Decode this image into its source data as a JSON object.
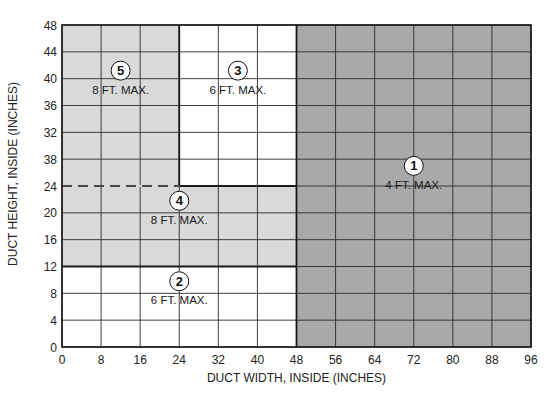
{
  "chart_data": {
    "type": "heatmap",
    "title": "",
    "xlabel": "DUCT WIDTH, INSIDE (INCHES)",
    "ylabel": "DUCT HEIGHT, INSIDE (INCHES)",
    "xlim": [
      0,
      96
    ],
    "ylim": [
      0,
      48
    ],
    "grid": true,
    "x_ticks": [
      0,
      8,
      16,
      24,
      32,
      40,
      48,
      56,
      64,
      72,
      80,
      88,
      96
    ],
    "x_tick_labels": [
      "0",
      "8",
      "16",
      "24",
      "32",
      "40",
      "48",
      "56",
      "64",
      "72",
      "80",
      "88",
      "96"
    ],
    "y_ticks": [
      0,
      4,
      8,
      12,
      16,
      20,
      24,
      28,
      32,
      36,
      40,
      44,
      48
    ],
    "y_tick_labels": [
      "0",
      "4",
      "8",
      "12",
      "16",
      "20",
      "24",
      "38",
      "32",
      "36",
      "40",
      "44",
      "48"
    ],
    "regions": [
      {
        "id": "1",
        "label": "4 FT. MAX.",
        "x": [
          48,
          96
        ],
        "y": [
          0,
          48
        ],
        "fill": "#a9a9a9",
        "label_at": [
          72,
          27
        ]
      },
      {
        "id": "2",
        "label": "6 FT. MAX.",
        "x": [
          0,
          48
        ],
        "y": [
          0,
          12
        ],
        "fill": "#ffffff",
        "label_at": [
          24,
          9.8
        ]
      },
      {
        "id": "3",
        "label": "6 FT. MAX.",
        "x": [
          24,
          48
        ],
        "y": [
          24,
          48
        ],
        "fill": "#ffffff",
        "label_at": [
          36,
          41.2
        ]
      },
      {
        "id": "4",
        "label": "8 FT. MAX.",
        "x": [
          0,
          48
        ],
        "y": [
          12,
          24
        ],
        "fill": "#d9d9d9",
        "label_at": [
          24,
          21.8
        ]
      },
      {
        "id": "5",
        "label": "8 FT. MAX.",
        "x": [
          0,
          24
        ],
        "y": [
          24,
          48
        ],
        "fill": "#d9d9d9",
        "label_at": [
          12,
          41.2
        ]
      }
    ],
    "dashed_lines": [
      {
        "x": [
          0,
          24
        ],
        "y": [
          24,
          24
        ]
      }
    ],
    "boundaries": [
      {
        "x": [
          24,
          24
        ],
        "y": [
          24,
          48
        ]
      },
      {
        "x": [
          24,
          48
        ],
        "y": [
          24,
          24
        ]
      },
      {
        "x": [
          0,
          48
        ],
        "y": [
          12,
          12
        ]
      },
      {
        "x": [
          48,
          48
        ],
        "y": [
          0,
          48
        ]
      }
    ]
  },
  "colors": {
    "dark_fill": "#a9a9a9",
    "light_fill": "#d9d9d9",
    "white_fill": "#ffffff",
    "grid": "#2a2a2a",
    "frame": "#1a1a1a"
  }
}
